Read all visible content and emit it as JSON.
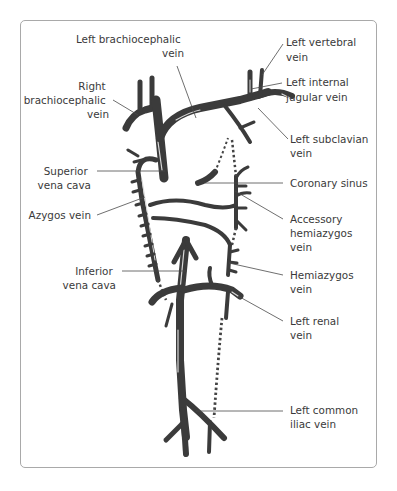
{
  "figure": {
    "colors": {
      "vein": "#3b3b3b",
      "highlight": "#d8d8d8",
      "text": "#3a3a3a",
      "frame": "#a9a9a9",
      "leader": "#4a4a4a"
    }
  },
  "labels": {
    "left_brachiocephalic": [
      "Left brachiocephalic",
      "vein"
    ],
    "right_brachiocephalic": [
      "Right",
      "brachiocephalic",
      "vein"
    ],
    "left_vertebral": [
      "Left vertebral",
      "vein"
    ],
    "left_internal_jugular": [
      "Left internal",
      "jugular vein"
    ],
    "left_subclavian": [
      "Left subclavian",
      "vein"
    ],
    "superior_vena_cava": [
      "Superior",
      "vena cava"
    ],
    "coronary_sinus": [
      "Coronary sinus"
    ],
    "azygos": [
      "Azygos vein"
    ],
    "accessory_hemiazygos": [
      "Accessory",
      "hemiazygos",
      "vein"
    ],
    "inferior_vena_cava": [
      "Inferior",
      "vena cava"
    ],
    "hemiazygos": [
      "Hemiazygos",
      "vein"
    ],
    "left_renal": [
      "Left renal",
      "vein"
    ],
    "left_common_iliac": [
      "Left common",
      "iliac vein"
    ]
  }
}
